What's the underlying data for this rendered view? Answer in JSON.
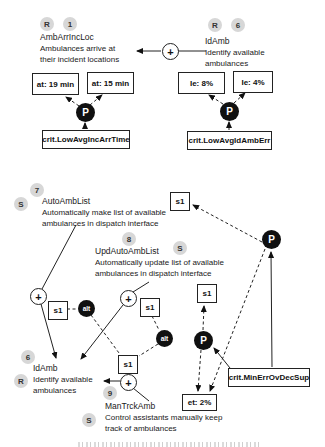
{
  "labels": {
    "p": "P",
    "alt": "alt",
    "plus": "+",
    "s1": "s1"
  },
  "top_left_goal": {
    "type_badge": "R",
    "num_badge": "1",
    "name": "AmbArrIncLoc",
    "desc1": "Ambulances arrive at",
    "desc2": "their incident locations",
    "measure1": "at: 19 min",
    "measure2": "at: 15 min",
    "crit": "crit.LowAvgIncArrTime"
  },
  "top_right_goal": {
    "type_badge": "R",
    "num_badge": "6",
    "name": "IdAmb",
    "desc1": "Identify available",
    "desc2": "ambulances",
    "measure1": "Ie: 8%",
    "measure2": "Ie: 4%",
    "crit": "crit.LowAvgIdAmbErr"
  },
  "auto_goal": {
    "num_badge": "7",
    "type_badge": "S",
    "name": "AutoAmbList",
    "desc1": "Automatically make list of available",
    "desc2": "ambulances in dispatch interface"
  },
  "upd_goal": {
    "num_badge": "8",
    "type_badge": "S",
    "name": "UpdAutoAmbList",
    "desc1": "Automatically update list of available",
    "desc2": "ambulances in dispatch interface"
  },
  "idamb_goal": {
    "num_badge": "6",
    "type_badge": "R",
    "name": "IdAmb",
    "desc1": "Identify available",
    "desc2": "ambulances"
  },
  "man_goal": {
    "num_badge": "9",
    "type_badge": "S",
    "name": "ManTrckAmb",
    "desc1": "Control assistants manually keep",
    "desc2": "track of ambulances"
  },
  "bottom": {
    "crit": "crit.MinErrOvDecSup",
    "measure": "et: 2%"
  }
}
